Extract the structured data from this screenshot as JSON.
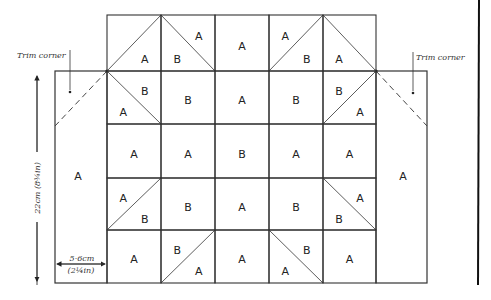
{
  "diagram": {
    "type": "quilt-block-layout",
    "grid": {
      "rows": 5,
      "cols": 5,
      "cells": [
        [
          {
            "diagonal": "up",
            "labels": [
              {
                "text": "A",
                "pos": "lower-right"
              }
            ]
          },
          {
            "diagonal": "down",
            "labels": [
              {
                "text": "B",
                "pos": "lower-left"
              },
              {
                "text": "A",
                "pos": "upper-right"
              }
            ]
          },
          {
            "diagonal": "none",
            "labels": [
              {
                "text": "A",
                "pos": "center"
              }
            ]
          },
          {
            "diagonal": "up",
            "labels": [
              {
                "text": "A",
                "pos": "upper-left"
              },
              {
                "text": "B",
                "pos": "lower-right"
              }
            ]
          },
          {
            "diagonal": "down",
            "labels": [
              {
                "text": "A",
                "pos": "lower-left"
              }
            ]
          }
        ],
        [
          {
            "diagonal": "down",
            "labels": [
              {
                "text": "A",
                "pos": "lower-left"
              },
              {
                "text": "B",
                "pos": "upper-right"
              }
            ]
          },
          {
            "diagonal": "none",
            "labels": [
              {
                "text": "B",
                "pos": "center"
              }
            ]
          },
          {
            "diagonal": "none",
            "labels": [
              {
                "text": "A",
                "pos": "center"
              }
            ]
          },
          {
            "diagonal": "none",
            "labels": [
              {
                "text": "B",
                "pos": "center"
              }
            ]
          },
          {
            "diagonal": "up",
            "labels": [
              {
                "text": "B",
                "pos": "upper-left"
              },
              {
                "text": "A",
                "pos": "lower-right"
              }
            ]
          }
        ],
        [
          {
            "diagonal": "none",
            "labels": [
              {
                "text": "A",
                "pos": "center"
              }
            ]
          },
          {
            "diagonal": "none",
            "labels": [
              {
                "text": "A",
                "pos": "center"
              }
            ]
          },
          {
            "diagonal": "none",
            "labels": [
              {
                "text": "B",
                "pos": "center"
              }
            ]
          },
          {
            "diagonal": "none",
            "labels": [
              {
                "text": "A",
                "pos": "center"
              }
            ]
          },
          {
            "diagonal": "none",
            "labels": [
              {
                "text": "A",
                "pos": "center"
              }
            ]
          }
        ],
        [
          {
            "diagonal": "up",
            "labels": [
              {
                "text": "A",
                "pos": "upper-left"
              },
              {
                "text": "B",
                "pos": "lower-right"
              }
            ]
          },
          {
            "diagonal": "none",
            "labels": [
              {
                "text": "B",
                "pos": "center"
              }
            ]
          },
          {
            "diagonal": "none",
            "labels": [
              {
                "text": "A",
                "pos": "center"
              }
            ]
          },
          {
            "diagonal": "none",
            "labels": [
              {
                "text": "B",
                "pos": "center"
              }
            ]
          },
          {
            "diagonal": "down",
            "labels": [
              {
                "text": "B",
                "pos": "lower-left"
              },
              {
                "text": "A",
                "pos": "upper-right"
              }
            ]
          }
        ],
        [
          {
            "diagonal": "none",
            "labels": [
              {
                "text": "A",
                "pos": "center"
              }
            ]
          },
          {
            "diagonal": "up",
            "labels": [
              {
                "text": "B",
                "pos": "upper-left"
              },
              {
                "text": "A",
                "pos": "lower-right"
              }
            ]
          },
          {
            "diagonal": "none",
            "labels": [
              {
                "text": "A",
                "pos": "center"
              }
            ]
          },
          {
            "diagonal": "down",
            "labels": [
              {
                "text": "A",
                "pos": "lower-left"
              },
              {
                "text": "B",
                "pos": "upper-right"
              }
            ]
          },
          {
            "diagonal": "none",
            "labels": [
              {
                "text": "A",
                "pos": "center"
              }
            ]
          }
        ]
      ]
    },
    "side_panels": {
      "left": {
        "label": "A"
      },
      "right": {
        "label": "A"
      }
    },
    "annotations": {
      "trim_left": "Trim corner",
      "trim_right": "Trim corner",
      "height_dimension": "22cm (8¾in)",
      "width_dimension_cm": "5·6cm",
      "width_dimension_in": "(2¼in)"
    },
    "colors": {
      "line": "#333333",
      "background": "#ffffff"
    }
  }
}
